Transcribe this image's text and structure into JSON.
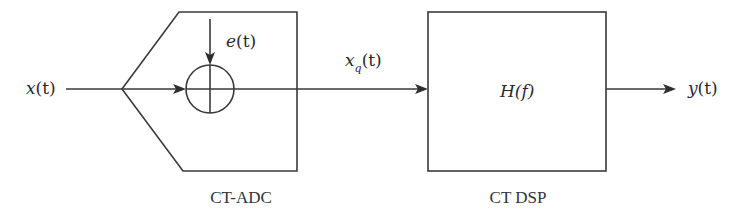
{
  "diagram": {
    "type": "block-diagram",
    "colors": {
      "stroke": "#3a3a3a",
      "text": "#2a2a2a",
      "background": "#ffffff"
    },
    "signals": {
      "input": {
        "base": "x",
        "arg": "(t)",
        "label": "x(t)"
      },
      "error": {
        "base": "e",
        "arg": "(t)",
        "label": "e(t)"
      },
      "quantized": {
        "base": "x",
        "sub": "q",
        "arg": "(t)",
        "label": "x_q(t)"
      },
      "output": {
        "base": "y",
        "arg": "(t)",
        "label": "y(t)"
      }
    },
    "blocks": {
      "adc": {
        "caption": "CT-ADC",
        "adder_symbol": "summing-junction"
      },
      "dsp": {
        "caption": "CT DSP",
        "transfer_function": "H(f)"
      }
    },
    "connections": [
      {
        "from": "x(t)",
        "to": "CT-ADC"
      },
      {
        "from": "e(t)",
        "to": "summing-junction"
      },
      {
        "from": "CT-ADC",
        "to": "CT DSP",
        "label": "x_q(t)"
      },
      {
        "from": "CT DSP",
        "to": "y(t)"
      }
    ]
  }
}
